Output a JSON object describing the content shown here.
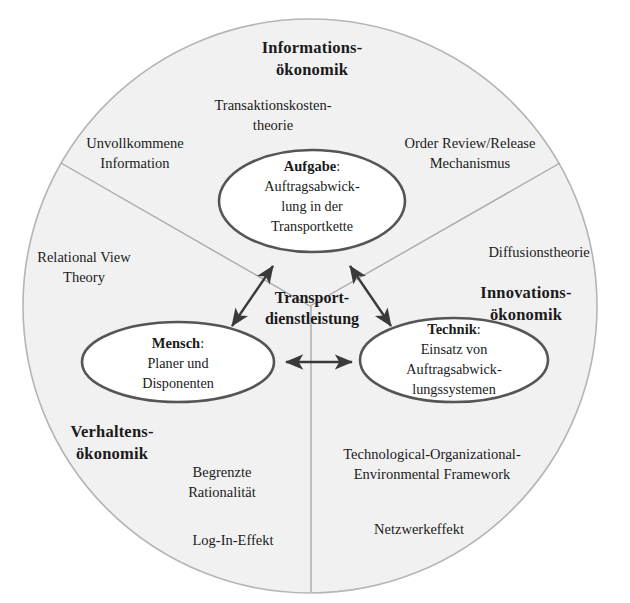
{
  "diagram": {
    "title_center": "Transport-\ndienstleistung",
    "center_label_lines": [
      "Transport-",
      "dienstleistung"
    ],
    "background_color": "#ffffff",
    "circle_fill": "#f0f0f0",
    "circle_stroke": "#b8b8b8",
    "ellipse_fill": "#ffffff",
    "ellipse_stroke": "#555555",
    "divider_color": "#aaaaaa",
    "arrow_color": "#3a3a3a",
    "text_color": "#1b1b1b"
  },
  "regions": [
    {
      "id": "informationsoekonomik",
      "title_lines": [
        "Informations-",
        "ökonomik"
      ],
      "theories": [
        {
          "id": "transaktionskostentheorie",
          "lines": [
            "Transaktionskosten-",
            "theorie"
          ]
        },
        {
          "id": "unvollkommene-information",
          "lines": [
            "Unvollkommene",
            "Information"
          ]
        },
        {
          "id": "order-review-release",
          "lines": [
            "Order Review/Release",
            "Mechanismus"
          ]
        }
      ]
    },
    {
      "id": "verhaltensoekonomik",
      "title_lines": [
        "Verhaltens-",
        "ökonomik"
      ],
      "theories": [
        {
          "id": "relational-view-theory",
          "lines": [
            "Relational View",
            "Theory"
          ]
        },
        {
          "id": "begrenzte-rationalitaet",
          "lines": [
            "Begrenzte",
            "Rationalität"
          ]
        },
        {
          "id": "log-in-effekt",
          "lines": [
            "Log-In-Effekt"
          ]
        }
      ]
    },
    {
      "id": "innovationsoekonomik",
      "title_lines": [
        "Innovations-",
        "ökonomik"
      ],
      "theories": [
        {
          "id": "diffusionstheorie",
          "lines": [
            "Diffusionstheorie"
          ]
        },
        {
          "id": "toe-framework",
          "lines": [
            "Technological-Organizational-",
            "Environmental Framework"
          ]
        },
        {
          "id": "netzwerkeffekt",
          "lines": [
            "Netzwerkeffekt"
          ]
        }
      ]
    }
  ],
  "nodes": [
    {
      "id": "aufgabe",
      "title": "Aufgabe",
      "title_suffix": ":",
      "body_lines": [
        "Auftragsabwick-",
        "lung in der",
        "Transportkette"
      ]
    },
    {
      "id": "mensch",
      "title": "Mensch",
      "title_suffix": ":",
      "body_lines": [
        "Planer und",
        "Disponenten"
      ]
    },
    {
      "id": "technik",
      "title": "Technik",
      "title_suffix": ":",
      "body_lines": [
        "Einsatz von",
        "Auftragsabwick-",
        "lungssystemen"
      ]
    }
  ],
  "connectors": [
    {
      "id": "mensch-aufgabe",
      "kind": "double-arrow"
    },
    {
      "id": "technik-aufgabe",
      "kind": "double-arrow"
    },
    {
      "id": "mensch-technik",
      "kind": "double-arrow"
    }
  ],
  "labels": {
    "informations_line1": "Informations-",
    "informations_line2": "ökonomik",
    "transaktion_line1": "Transaktionskosten-",
    "transaktion_line2": "theorie",
    "unvollkommene_line1": "Unvollkommene",
    "unvollkommene_line2": "Information",
    "orr_line1": "Order Review/Release",
    "orr_line2": "Mechanismus",
    "relational_line1": "Relational View",
    "relational_line2": "Theory",
    "diffusion_line1": "Diffusionstheorie",
    "innovations_line1": "Innovations-",
    "innovations_line2": "ökonomik",
    "verhaltens_line1": "Verhaltens-",
    "verhaltens_line2": "ökonomik",
    "begrenzte_line1": "Begrenzte",
    "begrenzte_line2": "Rationalität",
    "login_line1": "Log-In-Effekt",
    "toe_line1": "Technological-Organizational-",
    "toe_line2": "Environmental Framework",
    "netzwerk_line1": "Netzwerkeffekt",
    "transport_line1": "Transport-",
    "transport_line2": "dienstleistung",
    "aufgabe_title": "Aufgabe",
    "aufgabe_colon": ":",
    "aufgabe_l1": "Auftragsabwick-",
    "aufgabe_l2": "lung in der",
    "aufgabe_l3": "Transportkette",
    "mensch_title": "Mensch",
    "mensch_colon": ":",
    "mensch_l1": "Planer und",
    "mensch_l2": "Disponenten",
    "technik_title": "Technik",
    "technik_colon": ":",
    "technik_l1": "Einsatz von",
    "technik_l2": "Auftragsabwick-",
    "technik_l3": "lungssystemen"
  }
}
